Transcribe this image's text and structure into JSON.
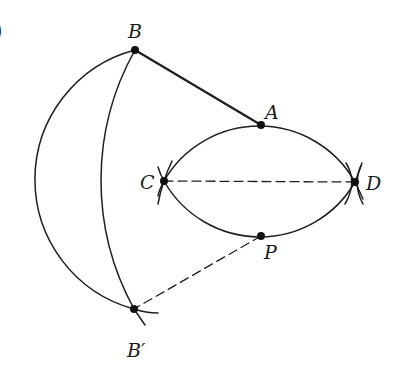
{
  "figure": {
    "edge_glyph": ")",
    "points": {
      "A": {
        "label": "A",
        "x": 261,
        "y": 125
      },
      "B": {
        "label": "B",
        "x": 135,
        "y": 50
      },
      "C": {
        "label": "C",
        "x": 164,
        "y": 181
      },
      "D": {
        "label": "D",
        "x": 355,
        "y": 182
      },
      "P": {
        "label": "P",
        "x": 261,
        "y": 236
      },
      "B_prime": {
        "label": "B′",
        "x": 134,
        "y": 309
      }
    },
    "segments": [
      {
        "from": "B",
        "to": "A",
        "style": "solid"
      },
      {
        "from": "C",
        "to": "D",
        "style": "dashed"
      },
      {
        "from": "P",
        "to": "B_prime",
        "style": "dashed"
      }
    ],
    "arcs": [
      {
        "name": "upper-lens-arc",
        "through": [
          "C",
          "A",
          "D"
        ]
      },
      {
        "name": "lower-lens-arc",
        "through": [
          "C",
          "P",
          "D"
        ]
      },
      {
        "name": "outer-reflection-arc",
        "through": [
          "B",
          "B_prime"
        ]
      },
      {
        "name": "inner-reflection-arc",
        "through": [
          "B",
          "B_prime"
        ]
      }
    ],
    "colors": {
      "ink": "#1e1e1e",
      "background": "#ffffff"
    }
  }
}
